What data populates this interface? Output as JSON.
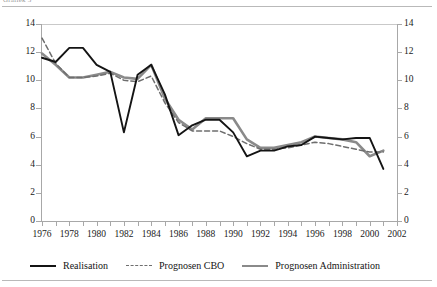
{
  "caption": {
    "clipped_top_text": "Grafiek 3"
  },
  "legend": {
    "position": "bottom",
    "items": [
      {
        "label": "Realisation",
        "style": "solid",
        "color": "#141414",
        "name": "realisation"
      },
      {
        "label": "Prognosen CBO",
        "style": "dashed",
        "color": "#6e6e6e",
        "name": "prognosen-cbo"
      },
      {
        "label": "Prognosen Administration",
        "style": "solid-thick",
        "color": "#8a8a8a",
        "name": "prognosen-administration"
      }
    ]
  },
  "axes": {
    "y_left_ticks": [
      "0",
      "2",
      "4",
      "6",
      "8",
      "10",
      "12",
      "14"
    ],
    "y_right_ticks": [
      "0",
      "2",
      "4",
      "6",
      "8",
      "10",
      "12",
      "14"
    ],
    "x_ticks": [
      "1976",
      "1978",
      "1980",
      "1982",
      "1984",
      "1986",
      "1988",
      "1990",
      "1992",
      "1994",
      "1996",
      "1998",
      "2000",
      "2002"
    ]
  },
  "chart_data": {
    "type": "line",
    "title": "",
    "xlabel": "",
    "ylabel": "",
    "xlim": [
      1976,
      2002
    ],
    "ylim": [
      0,
      14
    ],
    "ytick_step": 2,
    "xtick_step": 2,
    "grid": false,
    "legend_position": "bottom",
    "x": [
      1976,
      1977,
      1978,
      1979,
      1980,
      1981,
      1982,
      1983,
      1984,
      1985,
      1986,
      1987,
      1988,
      1989,
      1990,
      1991,
      1992,
      1993,
      1994,
      1995,
      1996,
      1997,
      1998,
      1999,
      2000,
      2001
    ],
    "series": [
      {
        "name": "Realisation",
        "color": "#141414",
        "style": "solid",
        "values": [
          11.6,
          11.3,
          12.3,
          12.3,
          11.1,
          10.6,
          6.3,
          10.4,
          11.1,
          9.0,
          6.1,
          6.8,
          7.2,
          7.2,
          6.3,
          4.6,
          5.0,
          5.0,
          5.3,
          5.4,
          6.0,
          5.9,
          5.8,
          5.9,
          5.9,
          3.7
        ]
      },
      {
        "name": "Prognosen CBO",
        "color": "#6e6e6e",
        "style": "dashed",
        "values": [
          13.0,
          11.2,
          10.2,
          10.2,
          10.3,
          10.5,
          10.0,
          9.9,
          10.3,
          8.4,
          7.0,
          6.4,
          6.4,
          6.4,
          6.0,
          5.5,
          5.1,
          5.1,
          5.2,
          5.4,
          5.6,
          5.5,
          5.3,
          5.1,
          4.9,
          4.9
        ]
      },
      {
        "name": "Prognosen Administration",
        "color": "#8a8a8a",
        "style": "solid-thick",
        "values": [
          11.9,
          11.1,
          10.2,
          10.2,
          10.4,
          10.6,
          10.2,
          10.1,
          11.1,
          8.7,
          7.2,
          6.5,
          7.3,
          7.3,
          7.3,
          5.8,
          5.2,
          5.2,
          5.4,
          5.6,
          6.0,
          5.9,
          5.8,
          5.6,
          4.6,
          5.0
        ]
      }
    ]
  }
}
